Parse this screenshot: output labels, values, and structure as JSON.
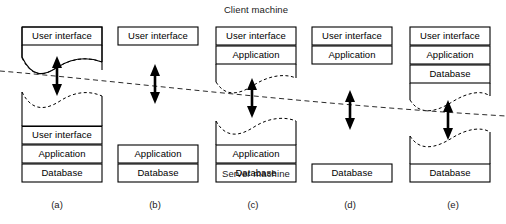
{
  "diagram": {
    "title_top": "Client machine",
    "title_bottom": "Server machine",
    "layer_names": {
      "ui": "User interface",
      "app": "Application",
      "db": "Database"
    },
    "columns": [
      {
        "id": "a",
        "label": "(a)",
        "client_boxes": [
          "User interface"
        ],
        "server_boxes": [
          "User interface",
          "Application",
          "Database"
        ],
        "client_torn_bottom": true,
        "server_torn_top": true
      },
      {
        "id": "b",
        "label": "(b)",
        "client_boxes": [
          "User interface"
        ],
        "server_boxes": [
          "Application",
          "Database"
        ],
        "client_torn_bottom": false,
        "server_torn_top": false
      },
      {
        "id": "c",
        "label": "(c)",
        "client_boxes": [
          "User interface",
          "Application"
        ],
        "server_boxes": [
          "Application",
          "Database"
        ],
        "client_torn_bottom": true,
        "server_torn_top": true
      },
      {
        "id": "d",
        "label": "(d)",
        "client_boxes": [
          "User interface",
          "Application"
        ],
        "server_boxes": [
          "Database"
        ],
        "client_torn_bottom": false,
        "server_torn_top": false
      },
      {
        "id": "e",
        "label": "(e)",
        "client_boxes": [
          "User interface",
          "Application",
          "Database"
        ],
        "server_boxes": [
          "Database"
        ],
        "client_torn_bottom": true,
        "server_torn_top": true
      }
    ],
    "divider": {
      "style": "dashed",
      "left_y": 71,
      "right_y": 116
    },
    "arrow_count": 5,
    "colors": {
      "stroke": "#000000",
      "box_fill": "#ffffff",
      "text": "#000000",
      "divider": "#2b2b2b"
    }
  }
}
